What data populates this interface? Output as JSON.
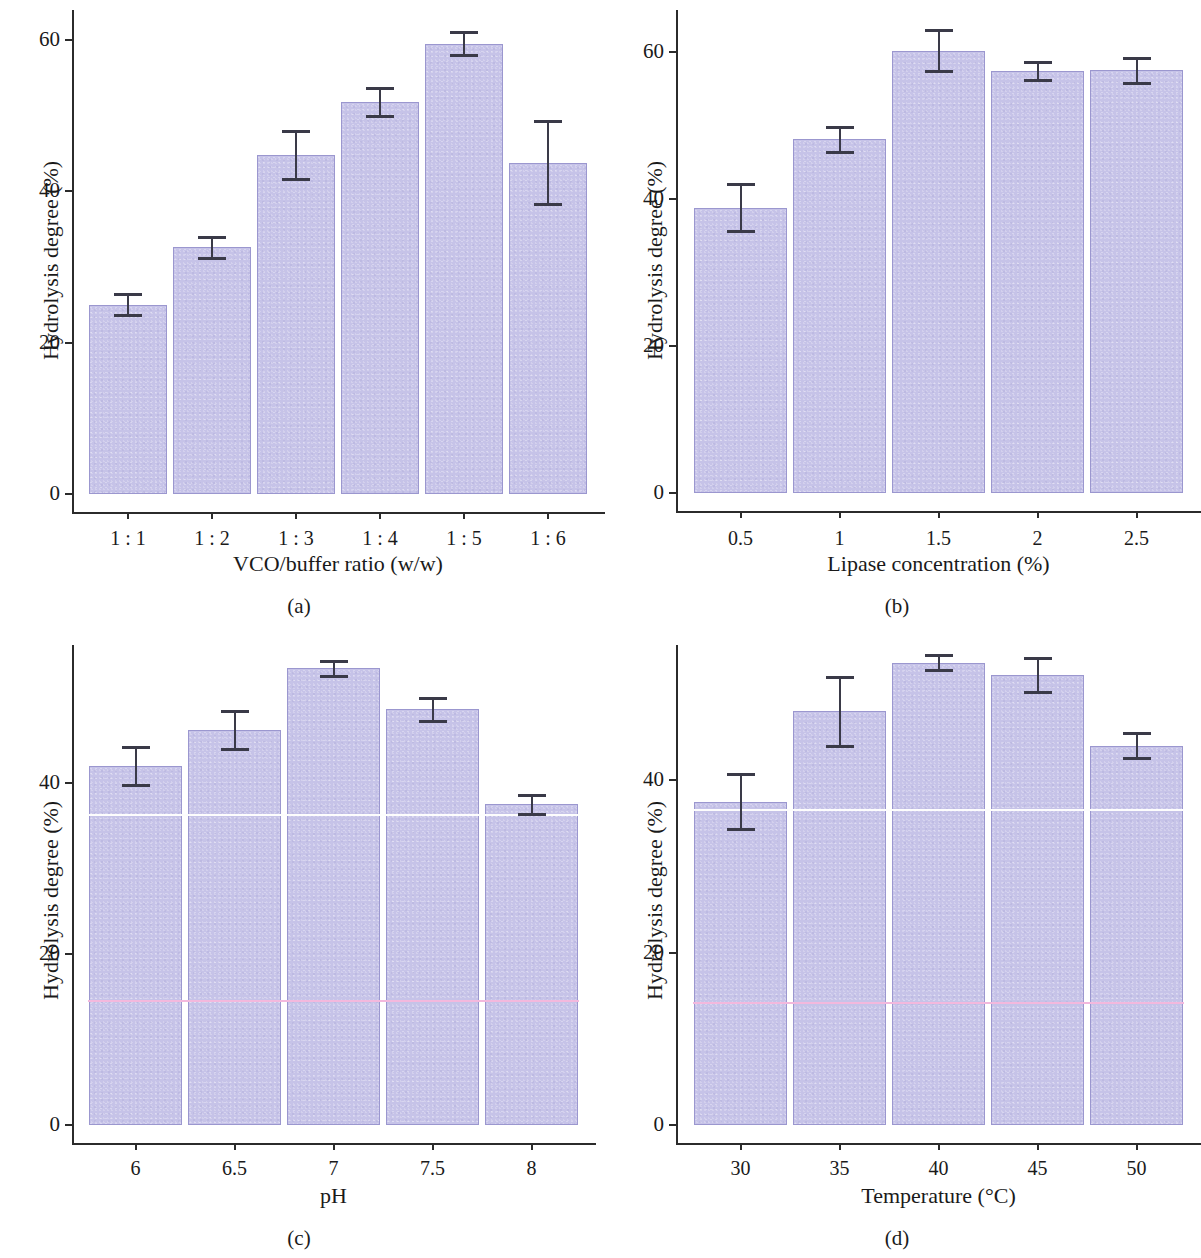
{
  "figure": {
    "y_axis_label": "Hydrolysis degree (%)",
    "background_color": "#ffffff",
    "bar_fill_color": "#c6c3e8",
    "bar_edge_color": "#9b97cf",
    "error_bar_color": "#3a3a48",
    "artifact_line_white": "#fdfdfd",
    "artifact_line_pink": "#f3b8dd"
  },
  "chart_data": [
    {
      "id": "a",
      "type": "bar",
      "caption": "(a)",
      "title": "",
      "xlabel": "VCO/buffer ratio (w/w)",
      "ylabel": "Hydrolysis degree (%)",
      "categories": [
        "1 : 1",
        "1 : 2",
        "1 : 3",
        "1 : 4",
        "1 : 5",
        "1 : 6"
      ],
      "values": [
        25.0,
        32.6,
        44.8,
        51.8,
        59.5,
        43.8
      ],
      "errors": [
        1.4,
        1.4,
        3.2,
        1.8,
        1.5,
        5.5
      ],
      "yticks": [
        0,
        20,
        40,
        60
      ],
      "ytick_labels": [
        "0",
        "20",
        "40",
        "60"
      ],
      "ylim": [
        0,
        66
      ],
      "grid": false,
      "legend": "none",
      "artifact_lines": []
    },
    {
      "id": "b",
      "type": "bar",
      "caption": "(b)",
      "title": "",
      "xlabel": "Lipase concentration (%)",
      "ylabel": "Hydrolysis degree (%)",
      "categories": [
        "0.5",
        "1",
        "1.5",
        "2",
        "2.5"
      ],
      "values": [
        38.8,
        48.1,
        60.2,
        57.4,
        57.5
      ],
      "errors": [
        3.2,
        1.7,
        2.8,
        1.2,
        1.7
      ],
      "yticks": [
        0,
        20,
        40,
        60
      ],
      "ytick_labels": [
        "0",
        "20",
        "40",
        "60"
      ],
      "ylim": [
        0,
        67
      ],
      "grid": false,
      "legend": "none",
      "artifact_lines": []
    },
    {
      "id": "c",
      "type": "bar",
      "caption": "(c)",
      "title": "",
      "xlabel": "pH",
      "ylabel": "Hydrolysis degree (%)",
      "categories": [
        "6",
        "6.5",
        "7",
        "7.5",
        "8"
      ],
      "values": [
        42.0,
        46.2,
        53.4,
        48.6,
        37.5
      ],
      "errors": [
        2.2,
        2.2,
        0.9,
        1.3,
        1.1
      ],
      "yticks": [
        0,
        20,
        40
      ],
      "ytick_labels": [
        "0",
        "20",
        "40"
      ],
      "ylim": [
        0,
        56
      ],
      "grid": false,
      "legend": "none",
      "artifact_lines": [
        {
          "value": 36.4,
          "color": "#fdfdfd"
        },
        {
          "value": 14.6,
          "color": "#f3b8dd"
        }
      ]
    },
    {
      "id": "d",
      "type": "bar",
      "caption": "(d)",
      "title": "",
      "xlabel": "Temperature (°C)",
      "ylabel": "Hydrolysis degree (%)",
      "categories": [
        "30",
        "35",
        "40",
        "45",
        "50"
      ],
      "values": [
        37.5,
        48.0,
        53.6,
        52.2,
        44.0
      ],
      "errors": [
        3.2,
        4.0,
        0.9,
        2.0,
        1.5
      ],
      "yticks": [
        0,
        20,
        40
      ],
      "ytick_labels": [
        "0",
        "20",
        "40"
      ],
      "ylim": [
        0,
        56
      ],
      "grid": false,
      "legend": "none",
      "artifact_lines": [
        {
          "value": 36.6,
          "color": "#fdfdfd"
        },
        {
          "value": 14.3,
          "color": "#f3b8dd"
        }
      ]
    }
  ]
}
